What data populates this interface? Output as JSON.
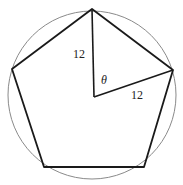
{
  "diagram": {
    "circle": {
      "cx": 92,
      "cy": 95,
      "r": 84,
      "stroke": "#8a8a8a"
    },
    "pentagon": {
      "vertices": [
        [
          92,
          9
        ],
        [
          173,
          70
        ],
        [
          144,
          167
        ],
        [
          44,
          167
        ],
        [
          12,
          69
        ]
      ],
      "stroke": "#1a1a1a"
    },
    "center": [
      94,
      97
    ],
    "radii": [
      {
        "from": [
          94,
          97
        ],
        "to": [
          92,
          9
        ],
        "label": "12"
      },
      {
        "from": [
          94,
          97
        ],
        "to": [
          173,
          70
        ],
        "label": "12"
      }
    ],
    "labels": {
      "radius_top": "12",
      "radius_right": "12",
      "angle": "θ"
    }
  }
}
